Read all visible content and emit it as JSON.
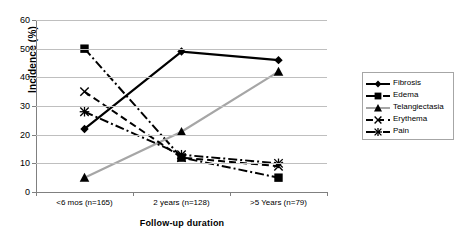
{
  "chart_data": {
    "type": "line",
    "title": "",
    "xlabel": "Follow-up duration",
    "ylabel": "Incidence (%)",
    "categories": [
      "<6 mos (n=165)",
      "2 years (n=128)",
      ">5 Years (n=79)"
    ],
    "ylim": [
      0,
      60
    ],
    "yticks": [
      0,
      10,
      20,
      30,
      40,
      50,
      60
    ],
    "grid": true,
    "legend_position": "right",
    "series": [
      {
        "name": "Fibrosis",
        "values": [
          22,
          49,
          46
        ],
        "color": "#000000",
        "line": "solid",
        "marker": "diamond"
      },
      {
        "name": "Edema",
        "values": [
          50,
          12,
          5
        ],
        "color": "#000000",
        "line": "dashdot",
        "marker": "square"
      },
      {
        "name": "Telangiectasia",
        "values": [
          5,
          21,
          42
        ],
        "color": "#a6a6a6",
        "line": "solid",
        "marker": "triangle"
      },
      {
        "name": "Erythema",
        "values": [
          35,
          12,
          9
        ],
        "color": "#000000",
        "line": "dashed",
        "marker": "x"
      },
      {
        "name": "Pain",
        "values": [
          28,
          13,
          10
        ],
        "color": "#000000",
        "line": "dashdot",
        "marker": "asterisk"
      }
    ]
  },
  "axis": {
    "y_tick_labels": [
      "0",
      "10",
      "20",
      "30",
      "40",
      "50",
      "60"
    ],
    "y_title": "Incidence (%)",
    "x_title": "Follow-up duration",
    "x_tick_labels": [
      "<6 mos (n=165)",
      "2 years (n=128)",
      ">5 Years (n=79)"
    ]
  },
  "legend": {
    "items": [
      {
        "label": "Fibrosis"
      },
      {
        "label": "Edema"
      },
      {
        "label": "Telangiectasia"
      },
      {
        "label": "Erythema"
      },
      {
        "label": "Pain"
      }
    ]
  },
  "colors": {
    "grid": "#bfbfbf",
    "axis": "#808080",
    "black": "#000000",
    "gray_series": "#a6a6a6",
    "background": "#ffffff"
  }
}
